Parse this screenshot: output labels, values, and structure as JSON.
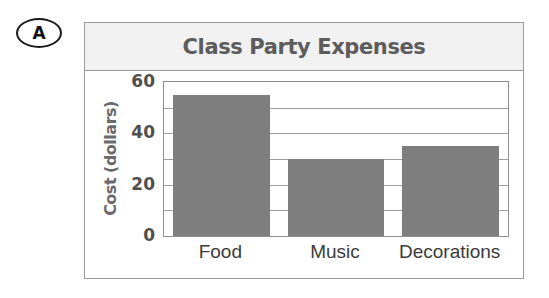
{
  "marker": {
    "letter": "A"
  },
  "chart_data": {
    "type": "bar",
    "title": "Class Party Expenses",
    "xlabel": "",
    "ylabel": "Cost (dollars)",
    "categories": [
      "Food",
      "Music",
      "Decorations"
    ],
    "values": [
      55,
      30,
      35
    ],
    "ylim": [
      0,
      60
    ],
    "tick_labels": [
      "0",
      "20",
      "40",
      "60"
    ],
    "tick_values": [
      0,
      20,
      40,
      60
    ],
    "gridlines": [
      10,
      20,
      30,
      40,
      50
    ],
    "grid": true,
    "legend": "none",
    "bar_color": "#7e7e7e",
    "title_color": "#5c5c5c",
    "banner_color": "#f1f1f1",
    "axis_color": "#8d8d8d"
  }
}
